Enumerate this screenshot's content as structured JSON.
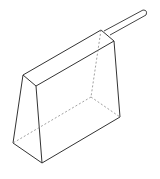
{
  "diagram": {
    "title": "",
    "colors": {
      "stroke": "#333333",
      "hidden_stroke": "#888888",
      "background": "#ffffff"
    },
    "labels": []
  }
}
